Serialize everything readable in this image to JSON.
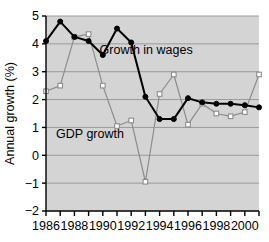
{
  "chart_data": {
    "type": "line",
    "title": "",
    "xlabel": "",
    "ylabel": "Annual growth (%)",
    "xlim": [
      1986,
      2001
    ],
    "ylim": [
      -2,
      5
    ],
    "grid": true,
    "grid_axis": "y",
    "legend_position": "inline-annotation",
    "background": "#d4d4d4",
    "x": [
      1986,
      1987,
      1988,
      1989,
      1990,
      1991,
      1992,
      1993,
      1994,
      1995,
      1996,
      1997,
      1998,
      1999,
      2000,
      2001
    ],
    "xticks": [
      1986,
      1987,
      1988,
      1989,
      1990,
      1991,
      1992,
      1993,
      1994,
      1995,
      1996,
      1997,
      1998,
      1999,
      2000,
      2001
    ],
    "xtick_labels": [
      "1986",
      "",
      "1988",
      "",
      "1990",
      "",
      "1992",
      "",
      "1994",
      "",
      "1996",
      "",
      "1998",
      "",
      "2000",
      ""
    ],
    "xtick_labels_shown": [
      "1986",
      "1988",
      "1990",
      "1992",
      "1994",
      "1996",
      "1998",
      "2000"
    ],
    "yticks": [
      -2,
      -1,
      0,
      1,
      2,
      3,
      4,
      5
    ],
    "ytick_labels": [
      "−2",
      "−1",
      "0",
      "1",
      "2",
      "3",
      "4",
      "5"
    ],
    "series": [
      {
        "name": "Growth in wages",
        "color": "#000000",
        "marker": "filled-circle",
        "marker_color": "#000000",
        "line_width": 2.0,
        "label_text": "Growth in wages",
        "label_x": 1993.05,
        "label_y": 3.62,
        "values": [
          4.1,
          4.8,
          4.25,
          4.1,
          3.6,
          4.55,
          4.05,
          2.1,
          1.3,
          1.3,
          2.05,
          1.9,
          1.85,
          1.85,
          1.8,
          1.72
        ]
      },
      {
        "name": "GDP growth",
        "color": "#8c8c8c",
        "marker": "open-circle",
        "marker_color": "#ffffff",
        "line_width": 1.2,
        "label_text": "GDP growth",
        "label_x": 1989.1,
        "label_y": 0.62,
        "values": [
          2.3,
          2.5,
          4.25,
          4.35,
          2.5,
          1.05,
          1.25,
          -0.95,
          2.2,
          2.9,
          1.1,
          1.85,
          1.5,
          1.4,
          1.55,
          2.9
        ]
      }
    ]
  },
  "axes": {
    "y_axis_title": "Annual growth (%)",
    "frame_color": "#000000",
    "gridline_color": "#9a9a9a",
    "plot_background": "#d4d4d4"
  }
}
